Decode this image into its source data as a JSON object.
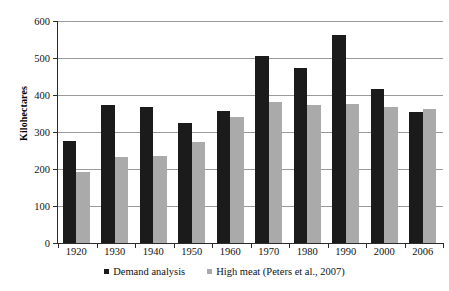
{
  "chart_data": {
    "type": "bar",
    "title": "",
    "subtitle": "",
    "xlabel": "",
    "ylabel": "Kilohectares",
    "categories": [
      "1920",
      "1930",
      "1940",
      "1950",
      "1960",
      "1970",
      "1980",
      "1990",
      "2000",
      "2006"
    ],
    "series": [
      {
        "name": "Demand analysis",
        "color": "#1b1b1b",
        "values": [
          276,
          372,
          367,
          325,
          358,
          505,
          472,
          562,
          415,
          355
        ]
      },
      {
        "name": "High meat (Peters et al., 2007)",
        "color": "#aaaaaa",
        "values": [
          192,
          233,
          236,
          273,
          340,
          380,
          373,
          377,
          368,
          362
        ]
      }
    ],
    "ylim": [
      0,
      600
    ],
    "yticks": [
      0,
      100,
      200,
      300,
      400,
      500,
      600
    ],
    "ytick_labels": [
      "0",
      "100",
      "200",
      "300",
      "400",
      "500",
      "600"
    ],
    "grid": true,
    "legend_position": "bottom",
    "axis_color": "#2b2b2b",
    "gridline_color": "#9a9a9a",
    "background_color": "#ffffff"
  }
}
